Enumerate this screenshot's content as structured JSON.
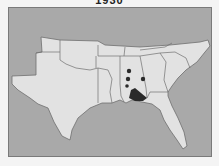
{
  "map": {
    "title": "1930",
    "region": "Southeastern United States",
    "colors": {
      "background": "#f4f4f4",
      "water_outside": "#a9a9a9",
      "land": "#e2e2e2",
      "border": "#6e6e6e",
      "occurrence": "#2a2a2a"
    },
    "markers": [
      {
        "x": 129,
        "y": 71,
        "r": 2.2
      },
      {
        "x": 128,
        "y": 79,
        "r": 2.2
      },
      {
        "x": 143,
        "y": 79,
        "r": 2.2
      },
      {
        "x": 127,
        "y": 86,
        "r": 1.8
      }
    ],
    "shaded_area": "Mobile Bay area, southern Alabama / Mississippi"
  }
}
